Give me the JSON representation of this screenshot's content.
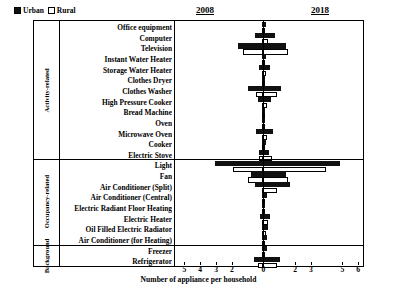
{
  "legend": {
    "urban_label": "Urban",
    "rural_label": "Rural"
  },
  "periods": {
    "left": "2008",
    "right": "2018"
  },
  "groups": [
    {
      "name": "Activity-related",
      "rows": 13
    },
    {
      "name": "Occupancy-related",
      "rows": 8
    },
    {
      "name": "Background",
      "rows": 2
    }
  ],
  "axis": {
    "xlabel": "Number of appliance per household",
    "ticks": [
      {
        "label": "5",
        "value": -5
      },
      {
        "label": "4",
        "value": -4
      },
      {
        "label": "3",
        "value": -3
      },
      {
        "label": "2",
        "value": -2
      },
      {
        "label": "0",
        "value": 0
      },
      {
        "label": "2",
        "value": 2
      },
      {
        "label": "3",
        "value": 3
      },
      {
        "label": "5",
        "value": 5
      },
      {
        "label": "6",
        "value": 6
      }
    ],
    "min": -5.6,
    "max": 6.3
  },
  "chart_data": {
    "type": "bar",
    "title": "",
    "subtitle": "",
    "xlabel": "Number of appliance per household",
    "ylabel": "",
    "xlim": [
      -5.6,
      6.3
    ],
    "grid": false,
    "legend_position": "top-left",
    "orientation": "horizontal",
    "note": "Diverging horizontal bars: left side (negative direction) = year 2008, right side (positive direction) = year 2018. Each category shows two bars: Urban (solid black) and Rural (open/white). Values are appliances per household.",
    "legend_entries": [
      "Urban",
      "Rural"
    ],
    "categories": [
      "Office equipment",
      "Computer",
      "Television",
      "Instant Water Heater",
      "Storage Water Heater",
      "Clothes Dryer",
      "Clothes Washer",
      "High Pressure Cooker",
      "Bread Machine",
      "Oven",
      "Microwave Oven",
      "Cooker",
      "Electric Stove",
      "Light",
      "Fan",
      "Air Conditioner (Split)",
      "Air Conditioner (Central)",
      "Electric Radiant Floor Heating",
      "Electric Heater",
      "Oil Filled Electric Radiator",
      "Air Conditioner (for Heating)",
      "Freezer",
      "Refrigerator"
    ],
    "series": [
      {
        "name": "Urban 2008",
        "side": "left",
        "fill": "solid",
        "values": [
          0.12,
          0.55,
          1.6,
          0.1,
          0.3,
          0.05,
          0.95,
          0.35,
          0.03,
          0.02,
          0.5,
          0.12,
          0.28,
          3.05,
          0.8,
          0.55,
          0.1,
          0.02,
          0.25,
          0.12,
          0.06,
          0.06,
          0.62
        ]
      },
      {
        "name": "Rural 2008",
        "side": "left",
        "fill": "open",
        "values": [
          0.02,
          0.1,
          1.3,
          0.04,
          0.08,
          0.01,
          0.45,
          0.12,
          0.01,
          0.01,
          0.08,
          0.05,
          0.3,
          1.95,
          0.95,
          0.12,
          0.02,
          0.01,
          0.1,
          0.04,
          0.02,
          0.03,
          0.35
        ]
      },
      {
        "name": "Urban 2018",
        "side": "right",
        "fill": "solid",
        "values": [
          0.18,
          0.7,
          1.45,
          0.18,
          0.42,
          0.1,
          1.1,
          0.5,
          0.08,
          0.06,
          0.62,
          0.18,
          0.38,
          4.85,
          1.45,
          1.7,
          0.22,
          0.05,
          0.42,
          0.3,
          0.2,
          0.22,
          1.05
        ]
      },
      {
        "name": "Rural 2018",
        "side": "right",
        "fill": "open",
        "values": [
          0.05,
          0.28,
          1.55,
          0.08,
          0.18,
          0.02,
          0.85,
          0.22,
          0.02,
          0.02,
          0.25,
          0.1,
          0.55,
          3.95,
          1.55,
          0.85,
          0.08,
          0.02,
          0.28,
          0.14,
          0.06,
          0.1,
          0.88
        ]
      }
    ]
  }
}
